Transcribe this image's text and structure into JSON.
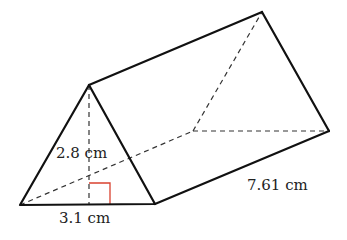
{
  "diagram": {
    "type": "triangular-prism",
    "labels": {
      "height": "2.8 cm",
      "base": "3.1 cm",
      "length": "7.61 cm"
    },
    "colors": {
      "edge": "#111111",
      "hidden_edge": "#333333",
      "right_angle_marker": "#d9412f"
    },
    "vertices": {
      "front_left": [
        20,
        205
      ],
      "front_right": [
        155,
        204
      ],
      "front_apex": [
        89,
        85
      ],
      "back_left": [
        193,
        131
      ],
      "back_right": [
        329,
        131
      ],
      "back_apex": [
        262,
        12
      ]
    }
  }
}
